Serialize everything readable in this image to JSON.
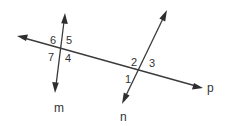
{
  "diagram": {
    "type": "two lines intersected by a transversal",
    "lines": [
      {
        "name": "p",
        "label": "p",
        "role": "transversal",
        "from": [
          17,
          36
        ],
        "to": [
          203,
          88
        ]
      },
      {
        "name": "m",
        "label": "m",
        "from": [
          65,
          13
        ],
        "to": [
          55,
          93
        ]
      },
      {
        "name": "n",
        "label": "n",
        "from": [
          167,
          10
        ],
        "to": [
          122,
          104
        ]
      }
    ],
    "line_labels": {
      "m": {
        "text": "m",
        "x": 54,
        "y": 112
      },
      "n": {
        "text": "n",
        "x": 120,
        "y": 121
      },
      "p": {
        "text": "p",
        "x": 207,
        "y": 92
      }
    },
    "intersections": {
      "m_p": {
        "angles": [
          {
            "number": "6",
            "x": 50,
            "y": 44
          },
          {
            "number": "5",
            "x": 66,
            "y": 44
          },
          {
            "number": "7",
            "x": 48,
            "y": 61
          },
          {
            "number": "4",
            "x": 65,
            "y": 62
          }
        ]
      },
      "n_p": {
        "angles": [
          {
            "number": "2",
            "x": 131,
            "y": 66
          },
          {
            "number": "3",
            "x": 149,
            "y": 67
          },
          {
            "number": "1",
            "x": 125,
            "y": 83
          }
        ]
      }
    },
    "colors": {
      "line": "#3a3a3a",
      "text": "#333333",
      "background": "#ffffff"
    }
  }
}
